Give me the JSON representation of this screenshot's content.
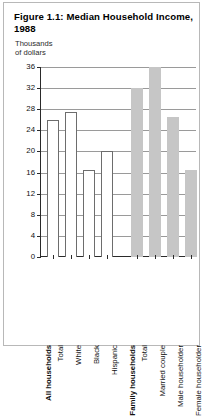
{
  "figure": {
    "title": "Figure 1.1:  Median Household Income, 1988",
    "axis_caption": "Thousands\nof dollars"
  },
  "chart_data": {
    "type": "bar",
    "title": "Figure 1.1:  Median Household Income, 1988",
    "xlabel": "",
    "ylabel": "Thousands of dollars",
    "ylim": [
      0,
      36
    ],
    "yticks": [
      0,
      4,
      8,
      12,
      16,
      20,
      24,
      28,
      32,
      36
    ],
    "ytick_labels": [
      "0",
      "4",
      "8",
      "12",
      "16",
      "20",
      "24",
      "28",
      "32",
      "36"
    ],
    "grid": true,
    "legend": "none",
    "groups": [
      {
        "name": "All households",
        "style": "open",
        "categories": [
          "Total",
          "White",
          "Black",
          "Hispanic"
        ],
        "values": [
          26.0,
          27.5,
          16.5,
          20.0
        ]
      },
      {
        "name": "Family households",
        "style": "filled",
        "categories": [
          "Total",
          "Married couple",
          "Male householder",
          "Female householder"
        ],
        "values": [
          32.0,
          36.0,
          26.5,
          16.5
        ]
      }
    ],
    "categories": [
      "Total",
      "White",
      "Black",
      "Hispanic",
      "Total",
      "Married couple",
      "Male householder",
      "Female householder"
    ],
    "values": [
      26.0,
      27.5,
      16.5,
      20.0,
      32.0,
      36.0,
      26.5,
      16.5
    ],
    "colors": {
      "open_bar_fill": "#ffffff",
      "open_bar_stroke": "#6d6d6d",
      "filled_bar": "#c6c6c6",
      "gridline": "#9a9a9a",
      "axis": "#2a2a2a"
    }
  }
}
